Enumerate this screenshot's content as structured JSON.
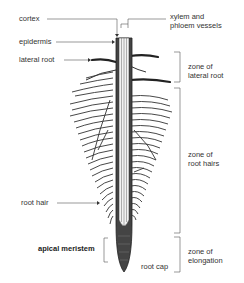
{
  "diagram": {
    "labels": {
      "cortex": "cortex",
      "epidermis": "epidermis",
      "lateral_root": "lateral root",
      "xylem_line1": "xylem and",
      "xylem_line2": "phloem vessels",
      "zone_lateral_line1": "zone of",
      "zone_lateral_line2": "lateral root",
      "zone_hairs_line1": "zone of",
      "zone_hairs_line2": "root hairs",
      "root_hair": "root hair",
      "apical_meristem": "apical meristem",
      "root_cap": "root cap",
      "zone_elong_line1": "zone of",
      "zone_elong_line2": "elongation"
    },
    "colors": {
      "line": "#555555",
      "root_dark": "#333333",
      "text": "#333333"
    }
  }
}
